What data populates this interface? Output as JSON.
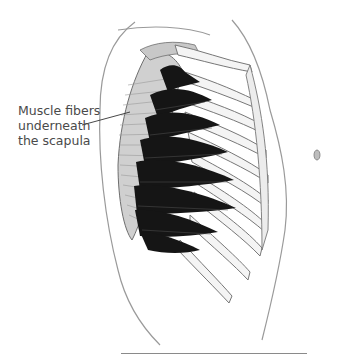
{
  "figure": {
    "callout": {
      "lines": [
        "Muscle fibers",
        "underneath",
        "the scapula"
      ]
    },
    "colors": {
      "background": "#ffffff",
      "muscle_dark": "#151515",
      "outline": "#6e6e6e",
      "scapula_shade": "#b8b8b8",
      "label_text": "#4a4a4a"
    }
  }
}
